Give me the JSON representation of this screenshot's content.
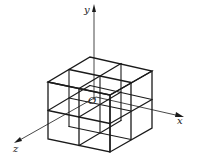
{
  "figure": {
    "labels": {
      "y_axis": "y",
      "x_axis": "x",
      "z_axis": "z",
      "origin": "O"
    },
    "colors": {
      "line": "#1a1a1a",
      "background": "#ffffff"
    },
    "grid": {
      "divisions_per_edge": 2
    }
  }
}
